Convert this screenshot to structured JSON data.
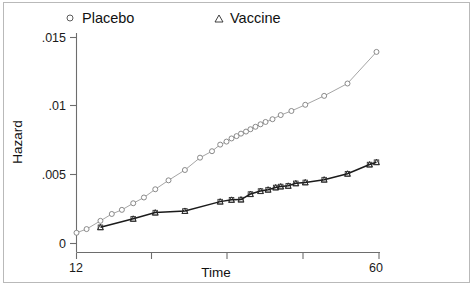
{
  "chart_data": {
    "type": "line",
    "title": "",
    "xlabel": "Time",
    "ylabel": "Hazard",
    "xlim": [
      12,
      60
    ],
    "ylim": [
      0,
      0.0155
    ],
    "grid": false,
    "legend_position": "top",
    "xticks": [
      12,
      24,
      36,
      48,
      60
    ],
    "xtick_labels": [
      "12",
      "",
      "",
      "",
      "60"
    ],
    "yticks": [
      0,
      0.005,
      0.01,
      0.015
    ],
    "ytick_labels": [
      "0",
      ".005",
      ".01",
      ".015"
    ],
    "series": [
      {
        "name": "Placebo",
        "marker": "circle",
        "color": "#9a9a9a",
        "x": [
          12.0,
          13.6,
          15.8,
          17.6,
          19.2,
          21.0,
          22.7,
          24.5,
          26.6,
          29.2,
          31.6,
          33.5,
          34.8,
          35.8,
          36.6,
          37.4,
          38.1,
          38.9,
          39.6,
          40.4,
          41.2,
          42.0,
          43.1,
          44.4,
          46.1,
          48.3,
          51.3,
          55.0,
          59.6
        ],
        "y": [
          0.00078,
          0.00105,
          0.00165,
          0.00215,
          0.00245,
          0.00293,
          0.00335,
          0.00395,
          0.0046,
          0.00535,
          0.00625,
          0.00672,
          0.0072,
          0.00742,
          0.00765,
          0.00782,
          0.008,
          0.00815,
          0.00832,
          0.0085,
          0.00868,
          0.00885,
          0.00905,
          0.00935,
          0.00965,
          0.0101,
          0.01075,
          0.01165,
          0.01395
        ]
      },
      {
        "name": "Vaccine",
        "marker": "triangle",
        "color": "#1b1b1b",
        "x": [
          15.8,
          21.0,
          24.5,
          29.2,
          34.8,
          36.6,
          38.1,
          39.6,
          41.2,
          42.4,
          43.6,
          44.4,
          45.6,
          46.8,
          48.3,
          51.3,
          55.0,
          58.5,
          59.6
        ],
        "y": [
          0.00118,
          0.0018,
          0.00225,
          0.00237,
          0.00305,
          0.00318,
          0.0032,
          0.0036,
          0.00382,
          0.00392,
          0.00408,
          0.00415,
          0.0042,
          0.00438,
          0.00445,
          0.00465,
          0.00508,
          0.00575,
          0.00592
        ]
      }
    ]
  },
  "legend": {
    "items": [
      {
        "label": "Placebo",
        "marker": "circle"
      },
      {
        "label": "Vaccine",
        "marker": "triangle"
      }
    ]
  }
}
